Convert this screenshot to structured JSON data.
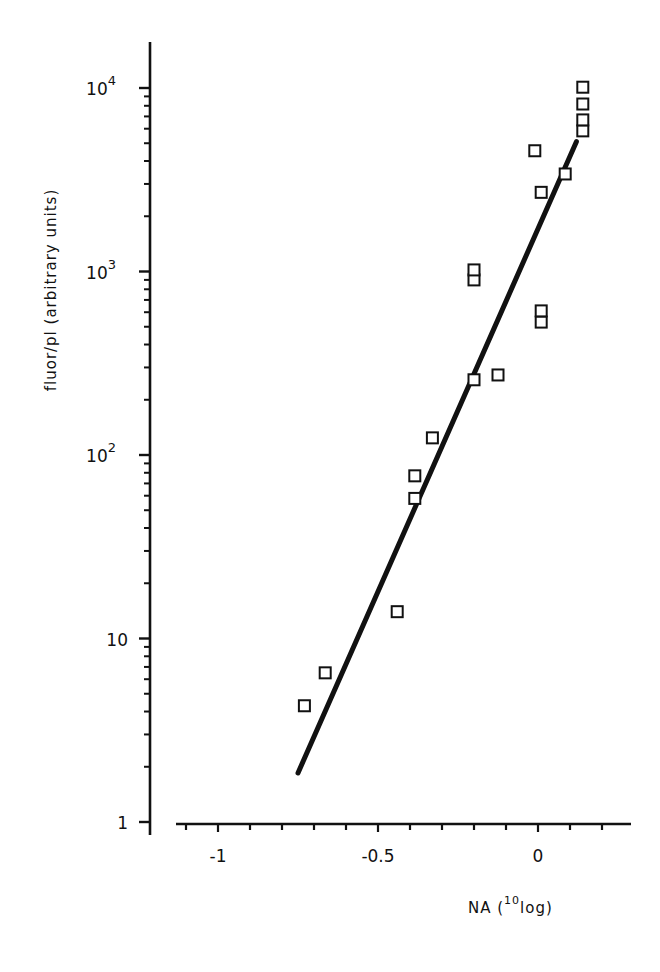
{
  "chart_data": {
    "type": "scatter",
    "title": "",
    "xlabel": "NA (10log)",
    "xlabel_parts": {
      "main": "NA (",
      "sup": "10",
      "tail": "log)"
    },
    "ylabel": "fluor/pl (arbitrary units)",
    "xscale": "linear",
    "yscale": "log",
    "xlim": [
      -1.12,
      0.28
    ],
    "ylim": [
      1,
      20000
    ],
    "x_ticks": [
      {
        "value": -1,
        "label": "-1"
      },
      {
        "value": -0.5,
        "label": "-0.5"
      },
      {
        "value": 0,
        "label": "0"
      }
    ],
    "x_minor_step": 0.1,
    "y_ticks": [
      {
        "value": 1,
        "base": "1",
        "exp": ""
      },
      {
        "value": 10,
        "base": "10",
        "exp": ""
      },
      {
        "value": 100,
        "base": "10",
        "exp": "2"
      },
      {
        "value": 1000,
        "base": "10",
        "exp": "3"
      },
      {
        "value": 10000,
        "base": "10",
        "exp": "4"
      }
    ],
    "grid": false,
    "legend": null,
    "series": [
      {
        "name": "measurements",
        "marker": "open-square",
        "points": [
          {
            "x": -0.73,
            "y": 4.3
          },
          {
            "x": -0.665,
            "y": 6.5
          },
          {
            "x": -0.44,
            "y": 14
          },
          {
            "x": -0.385,
            "y": 58
          },
          {
            "x": -0.385,
            "y": 77
          },
          {
            "x": -0.33,
            "y": 124
          },
          {
            "x": -0.2,
            "y": 257
          },
          {
            "x": -0.125,
            "y": 273
          },
          {
            "x": -0.2,
            "y": 900
          },
          {
            "x": -0.2,
            "y": 1020
          },
          {
            "x": 0.01,
            "y": 530
          },
          {
            "x": 0.01,
            "y": 610
          },
          {
            "x": -0.01,
            "y": 4550
          },
          {
            "x": 0.01,
            "y": 2700
          },
          {
            "x": 0.085,
            "y": 3400
          },
          {
            "x": 0.14,
            "y": 5840
          },
          {
            "x": 0.14,
            "y": 6700
          },
          {
            "x": 0.14,
            "y": 8180
          },
          {
            "x": 0.14,
            "y": 10100
          }
        ]
      },
      {
        "name": "regression line",
        "type": "line",
        "points": [
          {
            "x": -0.75,
            "y": 1.85
          },
          {
            "x": 0.12,
            "y": 5100
          }
        ]
      }
    ]
  }
}
